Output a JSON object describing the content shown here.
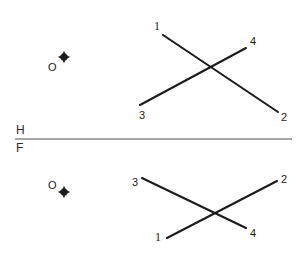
{
  "drawing": {
    "title": "Descriptive geometry two-view layout",
    "ink_color": "#1c1c1c",
    "fold_line_color": "#8a8a8a",
    "background": "#ffffff"
  },
  "fold_line": {
    "name": "H-F reference line",
    "upper_label": "H",
    "lower_label": "F",
    "x1": 15,
    "y1": 139,
    "x2": 292,
    "y2": 139,
    "upper_label_x": 16,
    "upper_label_y": 124,
    "lower_label_x": 16,
    "lower_label_y": 142
  },
  "top_view": {
    "name": "horizontal-view",
    "point": {
      "label": "O",
      "label_x": 48,
      "label_y": 62,
      "marker_x": 64,
      "marker_y": 57
    },
    "lines": [
      {
        "name": "line-1-2",
        "from_label": "1",
        "to_label": "2",
        "x1": 163,
        "y1": 35,
        "x2": 278,
        "y2": 112,
        "from_label_x": 154,
        "from_label_y": 20,
        "to_label_x": 281,
        "to_label_y": 112
      },
      {
        "name": "line-3-4",
        "from_label": "3",
        "to_label": "4",
        "x1": 140,
        "y1": 105,
        "x2": 246,
        "y2": 48,
        "from_label_x": 139,
        "from_label_y": 110,
        "to_label_x": 250,
        "to_label_y": 36
      }
    ]
  },
  "front_view": {
    "name": "frontal-view",
    "point": {
      "label": "O",
      "label_x": 48,
      "label_y": 180,
      "marker_x": 64,
      "marker_y": 192
    },
    "lines": [
      {
        "name": "line-3-4",
        "from_label": "3",
        "to_label": "4",
        "x1": 142,
        "y1": 178,
        "x2": 246,
        "y2": 228,
        "from_label_x": 132,
        "from_label_y": 177,
        "to_label_x": 250,
        "to_label_y": 228
      },
      {
        "name": "line-1-2",
        "from_label": "1",
        "to_label": "2",
        "x1": 167,
        "y1": 238,
        "x2": 277,
        "y2": 181,
        "from_label_x": 155,
        "from_label_y": 231,
        "to_label_x": 281,
        "to_label_y": 174
      }
    ]
  }
}
